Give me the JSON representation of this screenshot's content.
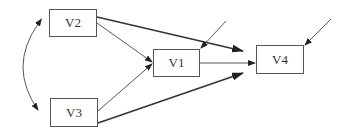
{
  "diagram": {
    "type": "path-diagram",
    "nodes": [
      {
        "id": "V2",
        "label": "V2",
        "x": 49,
        "y": 9,
        "w": 48,
        "h": 28
      },
      {
        "id": "V3",
        "label": "V3",
        "x": 50,
        "y": 98,
        "w": 48,
        "h": 29
      },
      {
        "id": "V1",
        "label": "V1",
        "x": 153,
        "y": 49,
        "w": 47,
        "h": 28
      },
      {
        "id": "V4",
        "label": "V4",
        "x": 256,
        "y": 45,
        "w": 48,
        "h": 29
      }
    ],
    "edges": [
      {
        "from": "V2",
        "to": "V1",
        "kind": "directed"
      },
      {
        "from": "V3",
        "to": "V1",
        "kind": "directed"
      },
      {
        "from": "V2",
        "to": "V4",
        "kind": "directed"
      },
      {
        "from": "V3",
        "to": "V4",
        "kind": "directed"
      },
      {
        "from": "V1",
        "to": "V4",
        "kind": "directed"
      },
      {
        "from": "V2",
        "to": "V3",
        "kind": "covariance"
      },
      {
        "from": "error",
        "to": "V1",
        "kind": "disturbance"
      },
      {
        "from": "error",
        "to": "V4",
        "kind": "disturbance"
      }
    ]
  }
}
